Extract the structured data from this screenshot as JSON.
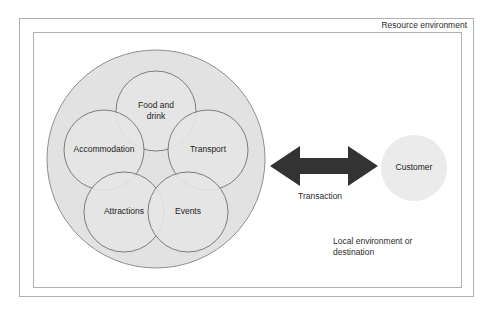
{
  "diagram": {
    "outer_box": {
      "name": "resource-environment",
      "label": "Resource environment",
      "border_color": "#b0b0b0",
      "fill": "#ffffff"
    },
    "inner_box": {
      "name": "local-environment",
      "label": "Local environment or destination",
      "border_color": "#b0b0b0",
      "fill": "#ffffff"
    },
    "supply_cluster": {
      "name": "supply-side-cluster",
      "fill": "#e2e2e2",
      "stroke": "#8f8f8f",
      "cx": 156,
      "cy": 159,
      "r": 109
    },
    "sectors": [
      {
        "id": "food-and-drink",
        "label": "Food and\ndrink",
        "cx": 156,
        "cy": 111,
        "r": 40
      },
      {
        "id": "accommodation",
        "label": "Accommodation",
        "cx": 104,
        "cy": 150,
        "r": 40
      },
      {
        "id": "transport",
        "label": "Transport",
        "cx": 208,
        "cy": 150,
        "r": 40
      },
      {
        "id": "attractions",
        "label": "Attractions",
        "cx": 124,
        "cy": 212,
        "r": 40
      },
      {
        "id": "events",
        "label": "Events",
        "cx": 188,
        "cy": 212,
        "r": 40
      }
    ],
    "sector_style": {
      "fill": "#e6e6e6",
      "stroke": "#7d7d7d"
    },
    "customer": {
      "id": "customer",
      "label": "Customer",
      "cx": 414,
      "cy": 168,
      "r": 33,
      "fill": "#ebebeb",
      "stroke": "none"
    },
    "arrow": {
      "id": "transaction-arrow",
      "label": "Transaction",
      "color": "#333333",
      "x_start": 270,
      "x_end": 378,
      "cy": 166,
      "direction": "bidirectional"
    }
  }
}
